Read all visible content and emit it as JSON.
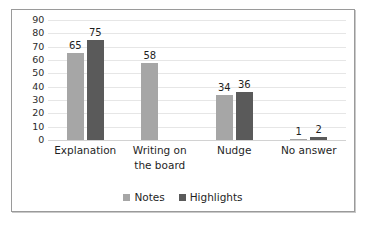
{
  "chart_data": {
    "type": "bar",
    "title": "",
    "subtitle": "",
    "xlabel": "",
    "ylabel": "",
    "ylim": [
      0,
      90
    ],
    "ytick_step": 10,
    "yticks": [
      "90",
      "80",
      "70",
      "60",
      "50",
      "40",
      "30",
      "20",
      "10",
      "0"
    ],
    "grid": true,
    "legend_position": "bottom",
    "categories": [
      "Explanation",
      "Writing on the board",
      "Nudge",
      "No answer"
    ],
    "category_lines": [
      [
        "Explanation"
      ],
      [
        "Writing on",
        "the board"
      ],
      [
        "Nudge"
      ],
      [
        "No answer"
      ]
    ],
    "series": [
      {
        "name": "Notes",
        "color": "#a6a6a6",
        "values": [
          65,
          58,
          34,
          1
        ],
        "labels": [
          "65",
          "58",
          "34",
          "1"
        ]
      },
      {
        "name": "Highlights",
        "color": "#5a5a5a",
        "values": [
          75,
          0,
          36,
          2
        ],
        "labels": [
          "75",
          "",
          "36",
          "2"
        ]
      }
    ]
  },
  "legend": {
    "items": [
      {
        "label": "Notes",
        "color": "#a6a6a6"
      },
      {
        "label": "Highlights",
        "color": "#5a5a5a"
      }
    ]
  },
  "colors": {
    "notes": "#a6a6a6",
    "highlights": "#5a5a5a",
    "gridline": "#e6e6e6",
    "border": "#9a9a9a",
    "text": "#1f1f1f",
    "background": "#ffffff"
  }
}
